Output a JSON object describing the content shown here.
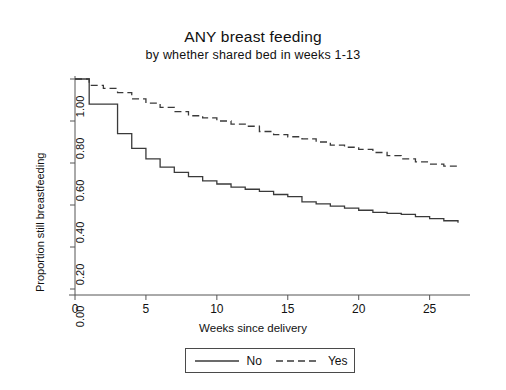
{
  "chart_data": {
    "type": "line",
    "subtype": "kaplan-meier-step",
    "title": "ANY breast feeding",
    "subtitle": "by whether shared bed in weeks 1-13",
    "xlabel": "Weeks since delivery",
    "ylabel": "Proportion still breastfeeding",
    "xlim": [
      0,
      27
    ],
    "ylim": [
      0,
      1
    ],
    "xticks": [
      0,
      5,
      10,
      15,
      20,
      25
    ],
    "xtick_labels": [
      "0",
      "5",
      "10",
      "15",
      "20",
      "25"
    ],
    "yticks": [
      0.0,
      0.2,
      0.4,
      0.6,
      0.8,
      1.0
    ],
    "ytick_labels": [
      "0.00",
      "0.20",
      "0.40",
      "0.60",
      "0.80",
      "1.00"
    ],
    "grid": false,
    "legend_position": "below-axis",
    "series": [
      {
        "name": "No",
        "linestyle": "solid",
        "color": "#3a3a3a",
        "x": [
          0,
          1,
          2,
          3,
          4,
          5,
          6,
          7,
          8,
          9,
          10,
          11,
          12,
          13,
          14,
          15,
          16,
          17,
          18,
          19,
          20,
          21,
          22,
          23,
          24,
          25,
          26,
          27
        ],
        "y": [
          1.0,
          0.88,
          0.88,
          0.74,
          0.67,
          0.62,
          0.58,
          0.555,
          0.535,
          0.515,
          0.5,
          0.485,
          0.475,
          0.465,
          0.45,
          0.44,
          0.415,
          0.405,
          0.395,
          0.385,
          0.375,
          0.365,
          0.36,
          0.355,
          0.345,
          0.335,
          0.325,
          0.315
        ]
      },
      {
        "name": "Yes",
        "linestyle": "dashed",
        "color": "#3a3a3a",
        "x": [
          0,
          1,
          2,
          3,
          4,
          5,
          6,
          7,
          8,
          9,
          10,
          11,
          12,
          13,
          14,
          15,
          16,
          17,
          18,
          19,
          20,
          21,
          22,
          23,
          24,
          25,
          26,
          27
        ],
        "y": [
          1.0,
          0.97,
          0.955,
          0.935,
          0.905,
          0.885,
          0.865,
          0.845,
          0.825,
          0.815,
          0.8,
          0.785,
          0.775,
          0.75,
          0.735,
          0.725,
          0.715,
          0.7,
          0.685,
          0.675,
          0.665,
          0.65,
          0.635,
          0.62,
          0.605,
          0.595,
          0.585,
          0.58
        ]
      }
    ]
  },
  "legend": {
    "entries": [
      {
        "label": "No",
        "style": "solid"
      },
      {
        "label": "Yes",
        "style": "dashed"
      }
    ]
  }
}
